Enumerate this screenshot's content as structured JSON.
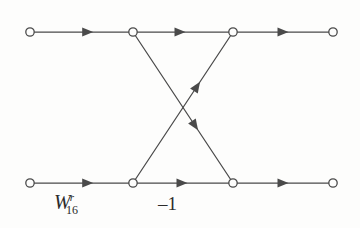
{
  "figure": {
    "kind": "signal-flow-graph",
    "background_color": "#fdfdfc",
    "stroke_color": "#4a4a4a",
    "text_color": "#2b2b2b",
    "node_fill": "#fdfdfc"
  },
  "labels": {
    "twiddle": {
      "base": "W",
      "superscript": "r",
      "subscript": "16",
      "full": "W_16^r"
    },
    "minus_one": "–1"
  },
  "chart_data": {
    "type": "diagram",
    "title": "",
    "xlabel": "",
    "ylabel": "",
    "nodes": [
      {
        "id": "in-top",
        "name": "top-left-input-node",
        "x": 30,
        "y": 32
      },
      {
        "id": "mid-top-a",
        "name": "top-first-junction-node",
        "x": 133,
        "y": 32
      },
      {
        "id": "mid-top-b",
        "name": "top-second-junction-node",
        "x": 233,
        "y": 32
      },
      {
        "id": "out-top",
        "name": "top-right-output-node",
        "x": 333,
        "y": 32
      },
      {
        "id": "in-bot",
        "name": "bottom-left-input-node",
        "x": 30,
        "y": 183
      },
      {
        "id": "mid-bot-a",
        "name": "bottom-first-junction-node",
        "x": 133,
        "y": 183
      },
      {
        "id": "mid-bot-b",
        "name": "bottom-second-junction-node",
        "x": 233,
        "y": 183
      },
      {
        "id": "out-bot",
        "name": "bottom-right-output-node",
        "x": 333,
        "y": 183
      }
    ],
    "node_radius": 4.2,
    "edges": [
      {
        "id": "e1",
        "name": "top-left-segment",
        "from": "in-top",
        "to": "mid-top-a",
        "arrow_t": 0.56
      },
      {
        "id": "e2",
        "name": "top-middle-segment",
        "from": "mid-top-a",
        "to": "mid-top-b",
        "arrow_t": 0.47
      },
      {
        "id": "e3",
        "name": "top-right-segment",
        "from": "mid-top-b",
        "to": "out-top",
        "arrow_t": 0.5
      },
      {
        "id": "e4",
        "name": "bottom-left-segment",
        "from": "in-bot",
        "to": "mid-bot-a",
        "arrow_t": 0.56
      },
      {
        "id": "e5",
        "name": "bottom-middle-segment",
        "from": "mid-bot-a",
        "to": "mid-bot-b",
        "arrow_t": 0.49
      },
      {
        "id": "e6",
        "name": "bottom-right-segment",
        "from": "mid-bot-b",
        "to": "out-bot",
        "arrow_t": 0.5
      },
      {
        "id": "e7",
        "name": "descending-cross-diagonal",
        "from": "mid-top-a",
        "to": "mid-bot-b",
        "arrow_t": 0.62
      },
      {
        "id": "e8",
        "name": "ascending-cross-diagonal",
        "from": "mid-bot-a",
        "to": "mid-top-b",
        "arrow_t": 0.64
      }
    ],
    "crossing_point": {
      "x": 183,
      "y": 108
    },
    "annotations": [
      {
        "id": "a1",
        "name": "twiddle-factor-label",
        "text": "W_16^r",
        "x": 54,
        "y": 192
      },
      {
        "id": "a2",
        "name": "minus-one-label",
        "text": "–1",
        "x": 158,
        "y": 194
      }
    ]
  }
}
